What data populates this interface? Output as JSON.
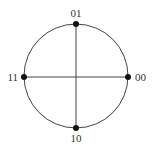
{
  "diagram": {
    "type": "constellation",
    "center": {
      "x": 76,
      "y": 76
    },
    "radius": 52,
    "points": [
      {
        "label": "01",
        "position": "top"
      },
      {
        "label": "00",
        "position": "right"
      },
      {
        "label": "10",
        "position": "bottom"
      },
      {
        "label": "11",
        "position": "left"
      }
    ],
    "colors": {
      "line": "#444444",
      "dot": "#111111",
      "text": "#333333"
    }
  }
}
